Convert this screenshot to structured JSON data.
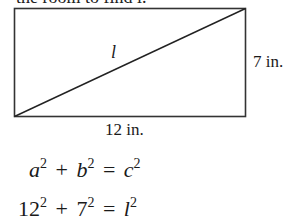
{
  "intro_text": "the room to find l.",
  "diagram": {
    "shape": "rectangle",
    "diagonal_label": "l",
    "height_label": "7 in.",
    "width_label": "12 in."
  },
  "equations": [
    {
      "terms": [
        {
          "base": "a",
          "exp": "2",
          "italic": true
        },
        {
          "op": "+"
        },
        {
          "base": "b",
          "exp": "2",
          "italic": true
        },
        {
          "op": "="
        },
        {
          "base": "c",
          "exp": "2",
          "italic": true
        }
      ]
    },
    {
      "terms": [
        {
          "base": "12",
          "exp": "2",
          "italic": false
        },
        {
          "op": "+"
        },
        {
          "base": "7",
          "exp": "2",
          "italic": false
        },
        {
          "op": "="
        },
        {
          "base": "l",
          "exp": "2",
          "italic": true
        }
      ]
    }
  ],
  "eq1": {
    "t1": "a",
    "e1": "2",
    "op1": "+",
    "t2": "b",
    "e2": "2",
    "op2": "=",
    "t3": "c",
    "e3": "2"
  },
  "eq2": {
    "t1": "12",
    "e1": "2",
    "op1": "+",
    "t2": "7",
    "e2": "2",
    "op2": "=",
    "t3": "l",
    "e3": "2"
  }
}
